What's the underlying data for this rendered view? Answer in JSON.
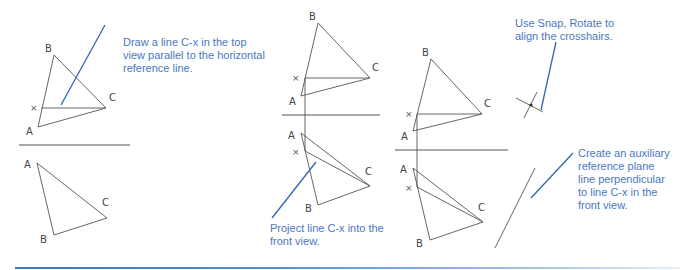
{
  "figure": {
    "colors": {
      "callout_text": "#4a78c2",
      "leader_line": "#2f66b3",
      "geometry": "#555555",
      "rule_start": "#3e74c0",
      "rule_end": "#e8f0f9"
    },
    "callouts": [
      {
        "id": "step1",
        "text": "Draw a line C-x in the top\nview parallel to the horizontal\nreference line."
      },
      {
        "id": "step2",
        "text": "Project line C-x into the\nfront view."
      },
      {
        "id": "step3",
        "text": "Use Snap, Rotate to\nalign the crosshairs."
      },
      {
        "id": "step4",
        "text": "Create an auxiliary\nreference plane\nline perpendicular\nto line C-x in the\nfront view."
      }
    ],
    "panel1": {
      "top_view": {
        "A": "A",
        "B": "B",
        "C": "C",
        "x": "×"
      },
      "front_view": {
        "A": "A",
        "B": "B",
        "C": "C"
      }
    },
    "panel2": {
      "top_view": {
        "A": "A",
        "B": "B",
        "C": "C",
        "x": "×"
      },
      "front_view": {
        "A": "A",
        "B": "B",
        "C": "C",
        "x": "×"
      }
    },
    "panel3": {
      "top_view": {
        "A": "A",
        "B": "B",
        "C": "C",
        "x": "×"
      },
      "front_view": {
        "A": "A",
        "B": "B",
        "C": "C",
        "x": "×"
      }
    }
  }
}
